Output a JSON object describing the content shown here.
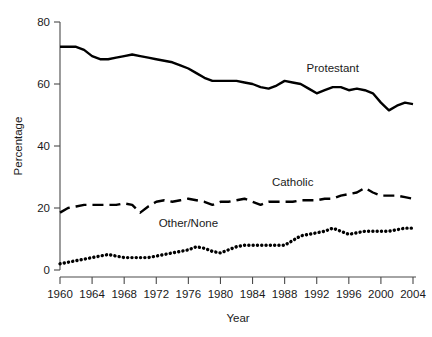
{
  "chart_data": {
    "type": "line",
    "title": "",
    "xlabel": "Year",
    "ylabel": "Percentage",
    "xlim": [
      1960,
      2004
    ],
    "ylim": [
      0,
      80
    ],
    "yticks": [
      0,
      20,
      40,
      60,
      80
    ],
    "ytick_labels": [
      "0",
      "20",
      "40",
      "60",
      "80"
    ],
    "xticks": [
      1960,
      1964,
      1968,
      1972,
      1976,
      1980,
      1984,
      1988,
      1992,
      1996,
      2000,
      2004
    ],
    "xtick_labels": [
      "1960",
      "1964",
      "1968",
      "1972",
      "1976",
      "1980",
      "1984",
      "1988",
      "1992",
      "1996",
      "2000",
      "2004"
    ],
    "grid": false,
    "legend_position": "inline-annotations",
    "x": [
      1960,
      1961,
      1962,
      1963,
      1964,
      1965,
      1966,
      1967,
      1968,
      1969,
      1970,
      1971,
      1972,
      1973,
      1974,
      1975,
      1976,
      1977,
      1978,
      1979,
      1980,
      1981,
      1982,
      1983,
      1984,
      1985,
      1986,
      1987,
      1988,
      1989,
      1990,
      1991,
      1992,
      1993,
      1994,
      1995,
      1996,
      1997,
      1998,
      1999,
      2000,
      2001,
      2002,
      2003,
      2004
    ],
    "series": [
      {
        "name": "Protestant",
        "style": "solid",
        "color": "#000000",
        "label_text": "Protestant",
        "label_x": 1994,
        "label_y": 64,
        "values": [
          72,
          72,
          72,
          71,
          69,
          68,
          68,
          68.5,
          69,
          69.5,
          69,
          68.5,
          68,
          67.5,
          67,
          66,
          65,
          63.5,
          62,
          61,
          61,
          61,
          61,
          60.5,
          60,
          59,
          58.5,
          59.5,
          61,
          60.5,
          60,
          58.5,
          57,
          58,
          59,
          59,
          58,
          58.5,
          58,
          57,
          54,
          51.5,
          53,
          54,
          53.5
        ]
      },
      {
        "name": "Catholic",
        "style": "dashed",
        "color": "#000000",
        "label_text": "Catholic",
        "label_x": 1989,
        "label_y": 27,
        "values": [
          18.5,
          20,
          20.5,
          21,
          21,
          21,
          21,
          21,
          21.5,
          21,
          18.5,
          20.5,
          22,
          22.5,
          22,
          22.5,
          23,
          22.5,
          22,
          21,
          22,
          22,
          22.5,
          23,
          22,
          21,
          22,
          22,
          22,
          22,
          22.5,
          22.5,
          22.5,
          23,
          23,
          24,
          24.5,
          25,
          26.5,
          25,
          24,
          24,
          24,
          23.5,
          23
        ]
      },
      {
        "name": "Other/None",
        "style": "dotted",
        "color": "#000000",
        "label_text": "Other/None",
        "label_x": 1976,
        "label_y": 14,
        "values": [
          2,
          2.5,
          3,
          3.5,
          4,
          4.5,
          5,
          4.5,
          4,
          4,
          4,
          4,
          4.5,
          5,
          5.5,
          6,
          6.5,
          7.5,
          7,
          6,
          5.5,
          6.5,
          7.5,
          8,
          8,
          8,
          8,
          8,
          8,
          9.5,
          11,
          11.5,
          12,
          12.5,
          13.5,
          12.5,
          11.5,
          12,
          12.5,
          12.5,
          12.5,
          12.5,
          13,
          13.5,
          13.5
        ]
      }
    ]
  },
  "axes": {
    "y_axis_title": "Percentage",
    "x_axis_title": "Year"
  }
}
